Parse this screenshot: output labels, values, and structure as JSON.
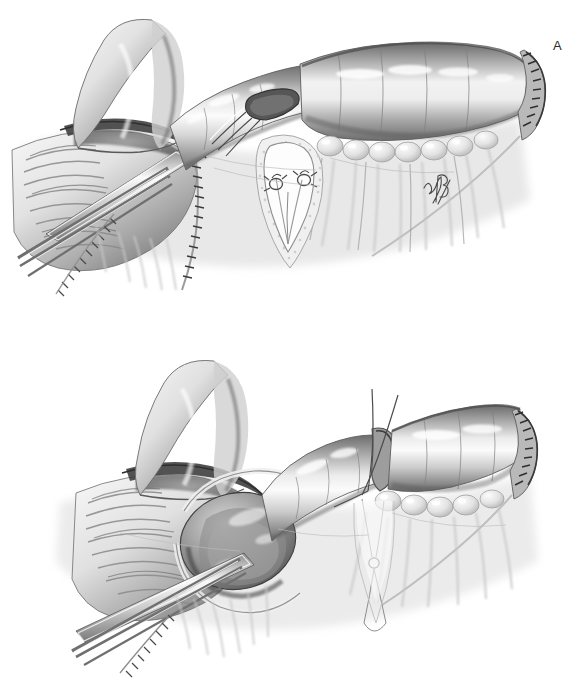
{
  "figure": {
    "background_color": "#ffffff",
    "width": 581,
    "height": 686,
    "medium": "grayscale airbrush and pen-and-ink medical illustration",
    "ink_color": "#2a2a2a",
    "tissue_light": "#f2f2f2",
    "tissue_mid": "#bdbdbd",
    "tissue_dark": "#6e6e6e",
    "tissue_shadow": "#3f3f3f",
    "panels": [
      {
        "id": "panel-a",
        "label": "A",
        "label_x": 553,
        "label_y": 39,
        "caption": "Bowel segment held open by clamp; V-shaped mesenteric window opened with two ligated vessels; distal end closed with staple line",
        "structures": [
          "curved proximal bowel limb",
          "opened bowel lumen with mucosal folds",
          "surgical clamp jaws",
          "forceps tips",
          "stapled transected edge",
          "defunctionalized bowel segment",
          "mesenteric V-shaped window",
          "ligated mesenteric vessels",
          "mesenteric fat lobules",
          "closed stapled bowel end"
        ]
      },
      {
        "id": "panel-b",
        "label": "B",
        "label_x": 449,
        "label_y": 401,
        "caption": "Bowel intussuscepted to form the nipple valve; traction sutures placed through the mesenteric window",
        "structures": [
          "curved proximal bowel limb",
          "opened bowel lumen with mucosal folds",
          "intussuscepted nipple valve",
          "surgical clamp jaws",
          "forceps tips",
          "stapled transected edge",
          "traction suture strands",
          "suture knot in mesenteric window",
          "mesenteric fat lobules",
          "closed stapled bowel end"
        ]
      }
    ],
    "signature": {
      "present": true,
      "x": 424,
      "y": 176,
      "description": "artist monogram signature in mesentery of panel A"
    }
  }
}
